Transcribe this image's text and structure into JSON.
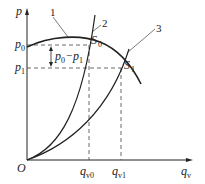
{
  "diagram": {
    "type": "pump-system characteristic curves",
    "axes": {
      "y_label": "p",
      "x_label": "q",
      "x_label_sub": "v",
      "origin_label": "O"
    },
    "levels": {
      "p0": {
        "main": "p",
        "sub": "0"
      },
      "p1": {
        "main": "p",
        "sub": "1"
      },
      "delta": {
        "text_a": "p",
        "sub_a": "0",
        "dash": "−",
        "text_b": "p",
        "sub_b": "1"
      }
    },
    "flows": {
      "qv0": {
        "main": "q",
        "sub": "v0"
      },
      "qv1": {
        "main": "q",
        "sub": "v1"
      }
    },
    "points": {
      "S0": {
        "main": "S",
        "sub": "0"
      },
      "S1": {
        "main": "S",
        "sub": "1"
      }
    },
    "curves": [
      {
        "id": "1",
        "label": "1"
      },
      {
        "id": "2",
        "label": "2"
      },
      {
        "id": "3",
        "label": "3"
      }
    ],
    "colors": {
      "line": "#222222",
      "dash": "#444444"
    }
  }
}
